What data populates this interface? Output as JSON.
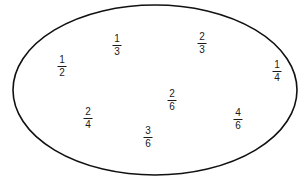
{
  "canvas": {
    "width": 306,
    "height": 181,
    "background_color": "#ffffff"
  },
  "top_caption": {
    "text": "1/2=4/8",
    "note": "faint, clipped by the top edge of the image"
  },
  "oval": {
    "shape": "ellipse",
    "stroke_color": "#111111",
    "fill_color": "none",
    "center_x": 155,
    "center_y": 90,
    "radius_x": 142,
    "radius_y": 85,
    "stroke_width": 1.6
  },
  "fractions": [
    {
      "label": "1/3",
      "numerator": "1",
      "denominator": "3",
      "x": 117,
      "y": 45
    },
    {
      "label": "2/3",
      "numerator": "2",
      "denominator": "3",
      "x": 202,
      "y": 43
    },
    {
      "label": "1/2",
      "numerator": "1",
      "denominator": "2",
      "x": 62,
      "y": 66
    },
    {
      "label": "1/4",
      "numerator": "1",
      "denominator": "4",
      "x": 277,
      "y": 71
    },
    {
      "label": "2/6",
      "numerator": "2",
      "denominator": "6",
      "x": 172,
      "y": 100
    },
    {
      "label": "2/4",
      "numerator": "2",
      "denominator": "4",
      "x": 88,
      "y": 118
    },
    {
      "label": "4/6",
      "numerator": "4",
      "denominator": "6",
      "x": 238,
      "y": 119
    },
    {
      "label": "3/6",
      "numerator": "3",
      "denominator": "6",
      "x": 148,
      "y": 137
    }
  ]
}
